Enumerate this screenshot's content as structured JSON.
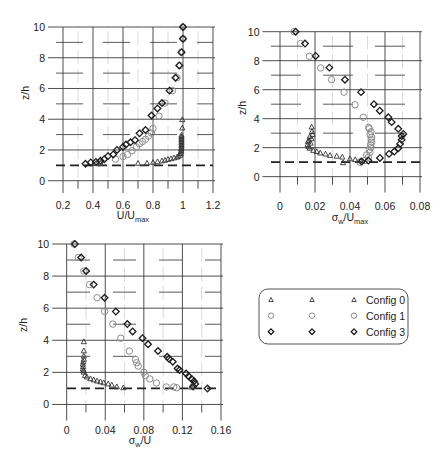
{
  "legend": {
    "entries": [
      {
        "label": "Config 0",
        "marker": "triangle"
      },
      {
        "label": "Config 1",
        "marker": "circle"
      },
      {
        "label": "Config 3",
        "marker": "diamond"
      }
    ],
    "position": "lower right panel"
  },
  "chart_data": [
    {
      "type": "scatter",
      "title": "",
      "xlabel": "U/Umax",
      "xlabel_parts": [
        {
          "t": "U/U"
        },
        {
          "t": "max",
          "sub": true
        }
      ],
      "ylabel": "z/h",
      "xlim": [
        0.1,
        1.2
      ],
      "ylim": [
        -0.8,
        10
      ],
      "xticks": [
        0.2,
        0.4,
        0.6,
        0.8,
        1,
        1.2
      ],
      "xticklabels": [
        "0.2",
        "0.4",
        "0.6",
        "0.8",
        "1",
        "1.2"
      ],
      "xminor": [
        0.3,
        0.5,
        0.7,
        0.9,
        1.1
      ],
      "yticks": [
        0,
        2,
        4,
        6,
        8,
        10
      ],
      "yticklabels": [
        "0",
        "2",
        "4",
        "6",
        "8",
        "10"
      ],
      "yminor": [
        1,
        3,
        5,
        7,
        9
      ],
      "grid": true,
      "reference_line": {
        "y": 1,
        "style": "dashed"
      },
      "series": [
        {
          "name": "Config 0",
          "marker": "triangle",
          "points": [
            [
              0.42,
              1.1
            ],
            [
              0.45,
              1.12
            ],
            [
              0.7,
              1.12
            ],
            [
              0.76,
              1.13
            ],
            [
              0.8,
              1.18
            ],
            [
              0.83,
              1.22
            ],
            [
              0.86,
              1.28
            ],
            [
              0.88,
              1.32
            ],
            [
              0.9,
              1.37
            ],
            [
              0.92,
              1.42
            ],
            [
              0.94,
              1.47
            ],
            [
              0.96,
              1.52
            ],
            [
              0.97,
              1.58
            ],
            [
              0.98,
              1.65
            ],
            [
              0.985,
              1.75
            ],
            [
              0.985,
              1.85
            ],
            [
              0.988,
              1.95
            ],
            [
              0.988,
              2.05
            ],
            [
              0.99,
              2.15
            ],
            [
              0.99,
              2.25
            ],
            [
              0.99,
              2.35
            ],
            [
              0.99,
              2.45
            ],
            [
              0.99,
              2.55
            ],
            [
              0.99,
              2.65
            ],
            [
              0.99,
              2.75
            ],
            [
              0.99,
              2.85
            ],
            [
              0.99,
              2.95
            ],
            [
              0.995,
              3.42
            ],
            [
              0.995,
              3.96
            ]
          ]
        },
        {
          "name": "Config 1",
          "marker": "circle",
          "points": [
            [
              0.44,
              1.15
            ],
            [
              0.55,
              1.4
            ],
            [
              0.6,
              1.57
            ],
            [
              0.63,
              1.7
            ],
            [
              0.66,
              1.95
            ],
            [
              0.69,
              2.2
            ],
            [
              0.71,
              2.4
            ],
            [
              0.73,
              2.55
            ],
            [
              0.75,
              2.7
            ],
            [
              0.77,
              2.9
            ],
            [
              0.79,
              3.1
            ],
            [
              0.8,
              3.4
            ],
            [
              0.84,
              4.2
            ],
            [
              0.88,
              5.05
            ],
            [
              0.93,
              5.86
            ],
            [
              0.96,
              6.7
            ],
            [
              0.98,
              7.5
            ],
            [
              0.99,
              8.36
            ],
            [
              1.0,
              9.24
            ],
            [
              1.0,
              10.0
            ]
          ]
        },
        {
          "name": "Config 3",
          "marker": "diamond",
          "points": [
            [
              0.35,
              1.1
            ],
            [
              0.385,
              1.19
            ],
            [
              0.42,
              1.22
            ],
            [
              0.45,
              1.3
            ],
            [
              0.475,
              1.4
            ],
            [
              0.5,
              1.6
            ],
            [
              0.535,
              1.71
            ],
            [
              0.56,
              2.0
            ],
            [
              0.6,
              2.2
            ],
            [
              0.62,
              2.35
            ],
            [
              0.65,
              2.5
            ],
            [
              0.68,
              2.64
            ],
            [
              0.71,
              3.08
            ],
            [
              0.75,
              3.3
            ],
            [
              0.79,
              4.24
            ],
            [
              0.83,
              4.7
            ],
            [
              0.86,
              5.05
            ],
            [
              0.91,
              5.86
            ],
            [
              0.95,
              6.7
            ],
            [
              0.975,
              7.5
            ],
            [
              0.99,
              8.36
            ],
            [
              1.0,
              9.24
            ],
            [
              1.0,
              10.0
            ]
          ]
        }
      ]
    },
    {
      "type": "scatter",
      "title": "",
      "xlabel": "σw/Umax",
      "xlabel_parts": [
        {
          "t": "σ"
        },
        {
          "t": "w",
          "sub": true
        },
        {
          "t": "/U"
        },
        {
          "t": "max",
          "sub": true
        }
      ],
      "ylabel": "z/h",
      "xlim": [
        -0.01,
        0.08
      ],
      "ylim": [
        -1.1,
        10
      ],
      "xticks": [
        0,
        0.02,
        0.04,
        0.06,
        0.08
      ],
      "xticklabels": [
        "0",
        "0.02",
        "0.04",
        "0.06",
        "0.08"
      ],
      "xminor": [
        0.01,
        0.03,
        0.05,
        0.07
      ],
      "yticks": [
        0,
        2,
        4,
        6,
        8,
        10
      ],
      "yticklabels": [
        "0",
        "2",
        "4",
        "6",
        "8",
        "10"
      ],
      "yminor": [
        1,
        3,
        5,
        7,
        9
      ],
      "grid": true,
      "reference_line": {
        "y": 1,
        "style": "dashed"
      },
      "series": [
        {
          "name": "Config 0",
          "marker": "triangle",
          "points": [
            [
              0.0181,
              3.41
            ],
            [
              0.0183,
              3.1
            ],
            [
              0.0186,
              2.9
            ],
            [
              0.017,
              2.75
            ],
            [
              0.018,
              2.6
            ],
            [
              0.0165,
              2.5
            ],
            [
              0.016,
              2.4
            ],
            [
              0.0175,
              2.3
            ],
            [
              0.0158,
              2.2
            ],
            [
              0.0163,
              2.05
            ],
            [
              0.017,
              1.95
            ],
            [
              0.019,
              1.8
            ],
            [
              0.021,
              1.72
            ],
            [
              0.023,
              1.62
            ],
            [
              0.026,
              1.55
            ],
            [
              0.0286,
              1.45
            ],
            [
              0.0324,
              1.4
            ],
            [
              0.0356,
              1.34
            ],
            [
              0.04,
              1.22
            ],
            [
              0.043,
              1.16
            ],
            [
              0.046,
              1.09
            ],
            [
              0.036,
              0.95
            ]
          ]
        },
        {
          "name": "Config 1",
          "marker": "circle",
          "points": [
            [
              0.008,
              10.0
            ],
            [
              0.0118,
              9.18
            ],
            [
              0.0168,
              8.3
            ],
            [
              0.0232,
              7.5
            ],
            [
              0.0295,
              6.69
            ],
            [
              0.0366,
              5.83
            ],
            [
              0.0429,
              4.96
            ],
            [
              0.0476,
              4.1
            ],
            [
              0.0507,
              3.4
            ],
            [
              0.051,
              3.3
            ],
            [
              0.052,
              3.1
            ],
            [
              0.0515,
              2.9
            ],
            [
              0.0524,
              2.72
            ],
            [
              0.0522,
              2.55
            ],
            [
              0.0524,
              2.37
            ],
            [
              0.0518,
              2.2
            ],
            [
              0.052,
              2.03
            ],
            [
              0.051,
              1.85
            ],
            [
              0.0514,
              1.68
            ],
            [
              0.0495,
              1.5
            ],
            [
              0.0505,
              1.34
            ],
            [
              0.0486,
              1.11
            ],
            [
              0.0457,
              1.0
            ]
          ]
        },
        {
          "name": "Config 3",
          "marker": "diamond",
          "points": [
            [
              0.009,
              10.0
            ],
            [
              0.0143,
              9.18
            ],
            [
              0.0204,
              8.33
            ],
            [
              0.0282,
              7.52
            ],
            [
              0.0371,
              6.69
            ],
            [
              0.0463,
              5.83
            ],
            [
              0.0537,
              5.0
            ],
            [
              0.057,
              4.55
            ],
            [
              0.0619,
              4.1
            ],
            [
              0.0638,
              3.76
            ],
            [
              0.0676,
              3.3
            ],
            [
              0.0705,
              2.95
            ],
            [
              0.0695,
              2.8
            ],
            [
              0.0695,
              2.54
            ],
            [
              0.0686,
              2.26
            ],
            [
              0.0676,
              1.96
            ],
            [
              0.0653,
              1.73
            ],
            [
              0.0623,
              1.57
            ],
            [
              0.0571,
              1.29
            ],
            [
              0.0505,
              1.11
            ],
            [
              0.0467,
              1.05
            ]
          ]
        }
      ]
    },
    {
      "type": "scatter",
      "title": "",
      "xlabel": "σw/U",
      "xlabel_parts": [
        {
          "t": "σ"
        },
        {
          "t": "w",
          "sub": true
        },
        {
          "t": "/U"
        }
      ],
      "ylabel": "z/h",
      "xlim": [
        -0.015,
        0.16
      ],
      "ylim": [
        -1,
        10
      ],
      "xticks": [
        0,
        0.04,
        0.08,
        0.12,
        0.16
      ],
      "xticklabels": [
        "0",
        "0.04",
        "0.08",
        "0.12",
        "0.16"
      ],
      "xminor": [
        0.02,
        0.06,
        0.1,
        0.14
      ],
      "yticks": [
        0,
        2,
        4,
        6,
        8,
        10
      ],
      "yticklabels": [
        "0",
        "2",
        "4",
        "6",
        "8",
        "10"
      ],
      "yminor": [
        1,
        3,
        5,
        7,
        9
      ],
      "grid": true,
      "reference_line": {
        "y": 1,
        "style": "dashed"
      },
      "series": [
        {
          "name": "Config 0",
          "marker": "triangle",
          "points": [
            [
              0.0178,
              3.9
            ],
            [
              0.0178,
              3.33
            ],
            [
              0.0178,
              3.0
            ],
            [
              0.0178,
              2.8
            ],
            [
              0.0172,
              2.65
            ],
            [
              0.0168,
              2.5
            ],
            [
              0.017,
              2.35
            ],
            [
              0.0168,
              2.2
            ],
            [
              0.0175,
              2.1
            ],
            [
              0.0178,
              2.0
            ],
            [
              0.019,
              1.8
            ],
            [
              0.021,
              1.7
            ],
            [
              0.0246,
              1.59
            ],
            [
              0.028,
              1.52
            ],
            [
              0.0315,
              1.45
            ],
            [
              0.035,
              1.4
            ],
            [
              0.0383,
              1.34
            ],
            [
              0.043,
              1.27
            ],
            [
              0.0468,
              1.2
            ],
            [
              0.052,
              1.09
            ],
            [
              0.0588,
              1.03
            ],
            [
              0.129,
              1.07
            ],
            [
              0.131,
              1.12
            ]
          ]
        },
        {
          "name": "Config 1",
          "marker": "circle",
          "points": [
            [
              0.0075,
              10.0
            ],
            [
              0.012,
              9.16
            ],
            [
              0.0178,
              8.32
            ],
            [
              0.0236,
              7.47
            ],
            [
              0.0315,
              6.65
            ],
            [
              0.0393,
              5.79
            ],
            [
              0.0479,
              5.01
            ],
            [
              0.0561,
              4.13
            ],
            [
              0.065,
              3.33
            ],
            [
              0.0714,
              2.81
            ],
            [
              0.0725,
              2.6
            ],
            [
              0.0742,
              2.39
            ],
            [
              0.08,
              2.01
            ],
            [
              0.0815,
              1.8
            ],
            [
              0.0862,
              1.59
            ],
            [
              0.093,
              1.34
            ],
            [
              0.1033,
              1.09
            ],
            [
              0.111,
              1.09
            ],
            [
              0.114,
              1.04
            ]
          ]
        },
        {
          "name": "Config 3",
          "marker": "diamond",
          "points": [
            [
              0.0085,
              10.0
            ],
            [
              0.015,
              9.16
            ],
            [
              0.0202,
              8.32
            ],
            [
              0.028,
              7.47
            ],
            [
              0.0393,
              6.65
            ],
            [
              0.051,
              5.79
            ],
            [
              0.0629,
              5.01
            ],
            [
              0.0684,
              4.55
            ],
            [
              0.0786,
              4.13
            ],
            [
              0.0844,
              3.75
            ],
            [
              0.0947,
              3.33
            ],
            [
              0.1043,
              2.97
            ],
            [
              0.106,
              2.85
            ],
            [
              0.11,
              2.66
            ],
            [
              0.115,
              2.24
            ],
            [
              0.117,
              2.15
            ],
            [
              0.1238,
              1.93
            ],
            [
              0.1265,
              1.76
            ],
            [
              0.1296,
              1.59
            ],
            [
              0.132,
              1.45
            ],
            [
              0.1333,
              1.28
            ],
            [
              0.131,
              1.12
            ],
            [
              0.146,
              0.99
            ]
          ]
        }
      ]
    }
  ]
}
